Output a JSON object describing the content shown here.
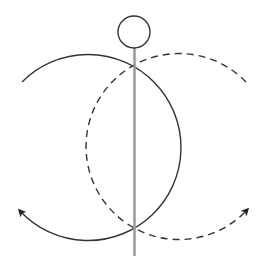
{
  "diagram": {
    "title": "",
    "background": "#ffffff",
    "elements": {
      "pivot_ball": {
        "cx": 134,
        "cy": 32,
        "r": 16,
        "stroke": "#333333"
      },
      "vertical_rod": {
        "x": 134.5,
        "y1": 49,
        "y2": 256,
        "stroke": "#999999"
      },
      "solid_arc": {
        "style": "solid",
        "center": [
          87,
          150
        ],
        "r": 93,
        "stroke": "#333333",
        "arrow_at": [
          18,
          213
        ],
        "direction": "counter-clockwise to lower-left"
      },
      "dashed_arc": {
        "style": "dashed",
        "center": [
          182,
          150
        ],
        "r": 93,
        "stroke": "#333333",
        "arrow_at": [
          248,
          213
        ],
        "direction": "clockwise to lower-right"
      }
    },
    "labels": []
  }
}
